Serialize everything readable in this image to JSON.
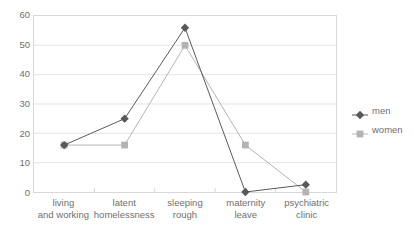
{
  "chart_data": {
    "type": "line",
    "title": "",
    "subtitle": "",
    "xlabel": "",
    "ylabel": "",
    "ylim": [
      0,
      60
    ],
    "ytick_step": 10,
    "yticks": [
      60,
      50,
      40,
      30,
      20,
      10,
      0
    ],
    "grid": true,
    "legend_position": "right",
    "categories": [
      "living\nand working",
      "latent\nhomelessness",
      "sleeping\nrough",
      "maternity\nleave",
      "psychiatric\nclinic"
    ],
    "category_lines": [
      [
        "living",
        "and working"
      ],
      [
        "latent",
        "homelessness"
      ],
      [
        "sleeping",
        "rough"
      ],
      [
        "maternity",
        "leave"
      ],
      [
        "psychiatric",
        "clinic"
      ]
    ],
    "series": [
      {
        "name": "men",
        "marker": "diamond",
        "color": "#595959",
        "values": [
          16,
          25,
          56,
          0,
          2.5
        ]
      },
      {
        "name": "women",
        "marker": "square",
        "color": "#b3b3b3",
        "values": [
          16,
          16,
          50,
          16,
          0
        ]
      }
    ]
  },
  "legend": {
    "items": [
      {
        "label": "men",
        "color": "#595959",
        "marker": "diamond"
      },
      {
        "label": "women",
        "color": "#b3b3b3",
        "marker": "square"
      }
    ]
  },
  "colors": {
    "men": "#595959",
    "women": "#b3b3b3",
    "grid": "#e4e4e4",
    "frame": "#d8d8d8",
    "text": "#6f6f6f",
    "background": "#ffffff"
  }
}
